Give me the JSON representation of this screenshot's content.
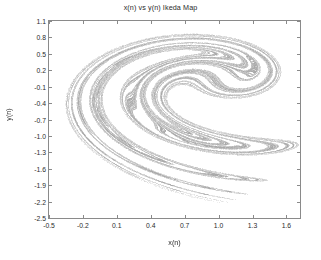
{
  "chart_data": {
    "type": "scatter",
    "title": "x(n) vs y(n) Ikeda Map",
    "xlabel": "x(n)",
    "ylabel": "y(n)",
    "xlim": [
      -0.5,
      1.72
    ],
    "ylim": [
      -2.5,
      1.1
    ],
    "grid": false,
    "legend": null,
    "marker": {
      "style": "dot",
      "size_px": 1,
      "color": "#8c8c8c",
      "opacity": 0.55
    },
    "xticks": [
      -0.5,
      -0.2,
      0.1,
      0.4,
      0.7,
      1.0,
      1.3,
      1.6
    ],
    "xtick_labels": [
      "-0.5",
      "-0.2",
      "0.1",
      "0.4",
      "0.7",
      "1.0",
      "1.3",
      "1.6"
    ],
    "yticks": [
      1.1,
      0.8,
      0.5,
      0.2,
      -0.1,
      -0.4,
      -0.7,
      -1.0,
      -1.3,
      -1.6,
      -1.9,
      -2.2,
      -2.5
    ],
    "ytick_labels": [
      "1.1",
      "0.8",
      "0.5",
      "0.2",
      "-0.1",
      "-0.4",
      "-0.7",
      "-1.0",
      "-1.3",
      "-1.6",
      "-1.9",
      "-2.2",
      "-2.5"
    ],
    "tick_direction": "in",
    "box": true,
    "generator": {
      "map": "ikeda",
      "equations": [
        "t(n) = c1 - c3 / (1 + x(n)^2 + y(n)^2)",
        "x(n+1) = 1 + u * (x(n)*cos(t) - y(n)*sin(t))",
        "y(n+1) = u * (x(n)*sin(t) + y(n)*cos(t))"
      ],
      "u": 0.9,
      "c1": 0.4,
      "c3": 6.0,
      "x0": 0.1,
      "y0": 0.1,
      "iterations": 120000,
      "transient": 200
    }
  }
}
